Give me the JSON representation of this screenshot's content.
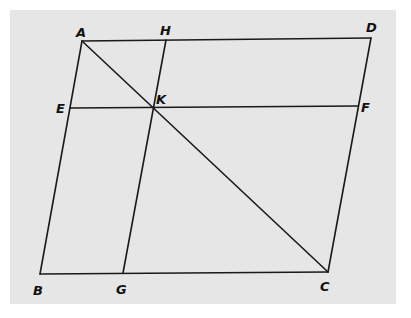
{
  "diagram": {
    "colors": {
      "background": "#e6e6e6",
      "stroke": "#1a1a1a",
      "label": "#111111"
    },
    "points": {
      "A": {
        "x": 82,
        "y": 41,
        "label": "A",
        "label_x": 76,
        "label_y": 37
      },
      "H": {
        "x": 166,
        "y": 40,
        "label": "H",
        "label_x": 160,
        "label_y": 35
      },
      "D": {
        "x": 371,
        "y": 38,
        "label": "D",
        "label_x": 366,
        "label_y": 32
      },
      "E": {
        "x": 70,
        "y": 108,
        "label": "E",
        "label_x": 56,
        "label_y": 113
      },
      "K": {
        "x": 152,
        "y": 108,
        "label": "K",
        "label_x": 156,
        "label_y": 104
      },
      "F": {
        "x": 358,
        "y": 106,
        "label": "F",
        "label_x": 361,
        "label_y": 112
      },
      "B": {
        "x": 40,
        "y": 274,
        "label": "B",
        "label_x": 33,
        "label_y": 295
      },
      "G": {
        "x": 123,
        "y": 273,
        "label": "G",
        "label_x": 116,
        "label_y": 294
      },
      "C": {
        "x": 328,
        "y": 272,
        "label": "C",
        "label_x": 320,
        "label_y": 291
      }
    },
    "segments": [
      {
        "from": "A",
        "to": "D"
      },
      {
        "from": "D",
        "to": "C"
      },
      {
        "from": "C",
        "to": "B"
      },
      {
        "from": "B",
        "to": "A"
      },
      {
        "from": "A",
        "to": "C"
      },
      {
        "from": "E",
        "to": "F"
      },
      {
        "from": "H",
        "to": "G"
      }
    ],
    "labels": [
      "A",
      "H",
      "D",
      "E",
      "K",
      "F",
      "B",
      "G",
      "C"
    ]
  }
}
